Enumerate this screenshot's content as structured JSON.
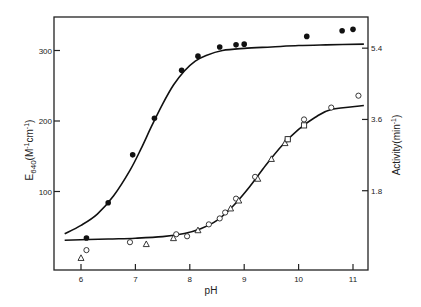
{
  "chart_data": {
    "type": "scatter",
    "title": "",
    "xlabel": "pH",
    "ylabel": "E640(M-1cm-1)",
    "ylabel_parts": {
      "base": "E",
      "sub": "640",
      "rest": "(M",
      "sup1": "-1",
      "mid": "cm",
      "sup2": "-1",
      "end": ")"
    },
    "y2label": "Activity(min-1)",
    "y2label_parts": {
      "base": "Activity(min",
      "sup": "-1",
      "end": ")"
    },
    "xlim": [
      5.65,
      11.3
    ],
    "ylim": [
      0,
      345
    ],
    "y2lim": [
      0,
      6.21
    ],
    "x_ticks": [
      6,
      7,
      8,
      9,
      10,
      11
    ],
    "x_tick_labels": [
      "6",
      "7",
      "8",
      "9",
      "10",
      "11"
    ],
    "y_ticks": [
      100,
      200,
      300
    ],
    "y_tick_labels": [
      "100",
      "200",
      "300"
    ],
    "y2_ticks": [
      1.8,
      3.6,
      5.4
    ],
    "y2_tick_labels": [
      "1.8",
      "3.6",
      "5.4"
    ],
    "grid": false,
    "legend": null,
    "series": [
      {
        "name": "E640 (filled circles)",
        "axis": "left",
        "marker": "filled-circle",
        "x": [
          6.1,
          6.5,
          6.95,
          7.35,
          7.85,
          8.15,
          8.55,
          8.85,
          9.0,
          10.15,
          10.8,
          11.0
        ],
        "y": [
          34,
          84,
          152,
          204,
          272,
          292,
          305,
          308,
          309,
          320,
          328,
          330
        ]
      },
      {
        "name": "Activity (open circles)",
        "axis": "right",
        "marker": "open-circle",
        "x": [
          6.1,
          6.9,
          7.75,
          7.95,
          8.35,
          8.55,
          8.65,
          8.85,
          9.2,
          9.8,
          10.1,
          10.6,
          11.1
        ],
        "y": [
          0.3,
          0.5,
          0.7,
          0.65,
          0.95,
          1.1,
          1.25,
          1.6,
          2.15,
          3.1,
          3.6,
          3.9,
          4.2
        ]
      },
      {
        "name": "Activity (open triangles)",
        "axis": "right",
        "marker": "open-triangle",
        "x": [
          6.0,
          7.2,
          7.7,
          8.15,
          8.75,
          8.9,
          9.25,
          9.5,
          9.75
        ],
        "y": [
          0.1,
          0.45,
          0.6,
          0.8,
          1.35,
          1.55,
          2.1,
          2.6,
          3.0
        ]
      },
      {
        "name": "Activity (open squares)",
        "axis": "right",
        "marker": "open-square",
        "x": [
          9.8,
          10.1
        ],
        "y": [
          3.1,
          3.45
        ]
      }
    ],
    "fit_curves": [
      {
        "name": "E640 titration fit",
        "axis": "left",
        "x": [
          5.7,
          6.0,
          6.3,
          6.6,
          6.9,
          7.1,
          7.3,
          7.5,
          7.7,
          7.9,
          8.1,
          8.3,
          8.6,
          9.0,
          9.5,
          10.0,
          10.5,
          11.2
        ],
        "y": [
          40,
          52,
          68,
          94,
          130,
          160,
          193,
          224,
          251,
          271,
          285,
          293,
          300,
          303,
          305,
          307,
          308,
          309
        ]
      },
      {
        "name": "Activity titration fit",
        "axis": "right",
        "x": [
          5.7,
          6.5,
          7.0,
          7.5,
          7.9,
          8.2,
          8.5,
          8.8,
          9.1,
          9.4,
          9.7,
          10.0,
          10.3,
          10.6,
          11.2
        ],
        "y": [
          0.55,
          0.58,
          0.6,
          0.64,
          0.72,
          0.84,
          1.05,
          1.42,
          1.9,
          2.45,
          2.95,
          3.35,
          3.65,
          3.85,
          3.95
        ]
      }
    ]
  }
}
